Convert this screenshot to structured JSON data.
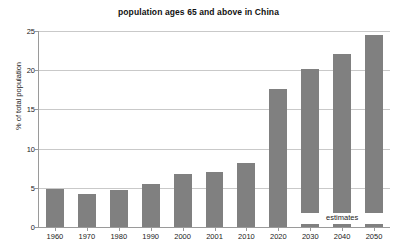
{
  "chart_data": {
    "type": "bar",
    "title": "population ages 65 and above in China",
    "xlabel": "",
    "ylabel": "% of total population",
    "categories": [
      "1960",
      "1970",
      "1980",
      "1990",
      "2000",
      "2001",
      "2010",
      "2020",
      "2030",
      "2040",
      "2050"
    ],
    "values": [
      4.8,
      4.2,
      4.7,
      5.5,
      6.8,
      7.0,
      8.2,
      17.6,
      20.2,
      22.1,
      24.5
    ],
    "ylim": [
      0,
      25
    ],
    "yticks": [
      0,
      5,
      10,
      15,
      20,
      25
    ],
    "ytick_labels": [
      "0",
      "5",
      "10",
      "15",
      "20",
      "25"
    ],
    "grid": true,
    "legend": "none",
    "bar_color": "#808080",
    "gridline_color": "#c9c9c9",
    "axis_color": "#9a9a9a",
    "background": "#ffffff",
    "annotations": [
      {
        "text": "estimates",
        "applies_to": [
          "2030",
          "2040",
          "2050"
        ],
        "note": "projected values; bars drawn with a break near the baseline"
      }
    ],
    "estimate_categories": [
      "2030",
      "2040",
      "2050"
    ]
  }
}
